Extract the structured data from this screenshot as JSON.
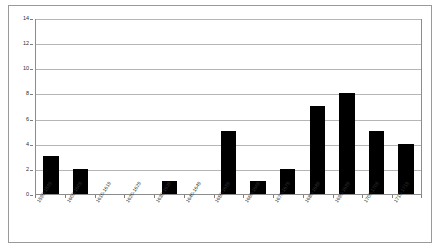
{
  "chart_data": {
    "type": "bar",
    "title": "",
    "subtitle": "",
    "xlabel": "",
    "ylabel": "",
    "ylim": [
      0,
      14
    ],
    "ytick_step": 2,
    "yticks": [
      0,
      2,
      4,
      6,
      8,
      10,
      12,
      14
    ],
    "ytick_labels": [
      "0",
      "2",
      "4",
      "6",
      "8",
      "10",
      "12",
      "14"
    ],
    "grid": true,
    "grid_axis": "y",
    "legend": false,
    "legend_position": "none",
    "bar_color": "#000000",
    "plot_background": "#ffffff",
    "gridline_color": "#b5b5b5",
    "border_color": "#8c8c8c",
    "categories": [
      "1590-1599",
      "1600-1609",
      "1610-1619",
      "1620-1629",
      "1630-1639",
      "1640-1649",
      "1650-1659",
      "1660-1669",
      "1670-1679",
      "1680-1689",
      "1690-1699",
      "1700-1709",
      "1710-1719"
    ],
    "values": [
      3,
      2,
      0,
      0,
      1,
      0,
      5,
      1,
      2,
      7,
      8,
      5,
      4
    ]
  }
}
